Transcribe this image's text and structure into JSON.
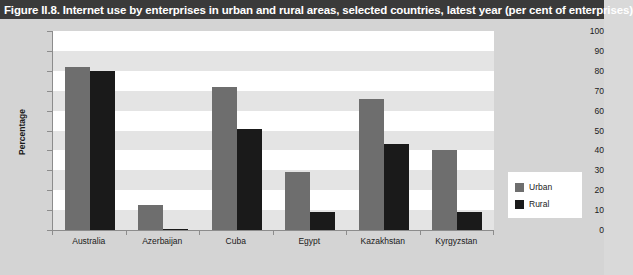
{
  "figure": {
    "title": "Figure II.8. Internet use by enterprises in urban and rural areas, selected countries, latest year (per cent of enterprises)"
  },
  "colors": {
    "title_bar_bg": "#3a3a3a",
    "title_text": "#ffffff",
    "page_bg": "#d4d4d4",
    "plot_bg": "#ffffff",
    "band": "#e4e4e4",
    "urban": "#6e6e6e",
    "rural": "#1a1a1a",
    "axis": "#8c8c8c"
  },
  "legend": {
    "position": "right",
    "entries": [
      {
        "label": "Urban",
        "color": "#6e6e6e"
      },
      {
        "label": "Rural",
        "color": "#1a1a1a"
      }
    ]
  },
  "chart_data": {
    "type": "bar",
    "title": "Figure II.8. Internet use by enterprises in urban and rural areas, selected countries, latest year (per cent of enterprises)",
    "xlabel": "",
    "ylabel": "Percentage",
    "ylim": [
      0,
      100
    ],
    "yticks": [
      0,
      10,
      20,
      30,
      40,
      50,
      60,
      70,
      80,
      90,
      100
    ],
    "ytick_labels": [
      "0",
      "10",
      "20",
      "30",
      "40",
      "50",
      "60",
      "70",
      "80",
      "90",
      "100"
    ],
    "grid": "horizontal-bands",
    "categories": [
      "Australia",
      "Azerbaijan",
      "Cuba",
      "Egypt",
      "Kazakhstan",
      "Kyrgyzstan"
    ],
    "series": [
      {
        "name": "Urban",
        "color": "#6e6e6e",
        "values": [
          82,
          12.5,
          72,
          29,
          66,
          40
        ]
      },
      {
        "name": "Rural",
        "color": "#1a1a1a",
        "values": [
          80,
          0.5,
          51,
          9,
          43,
          9
        ]
      }
    ]
  }
}
